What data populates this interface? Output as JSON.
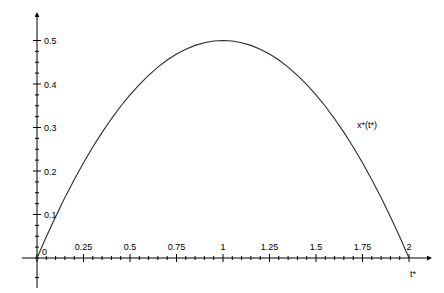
{
  "chart_data": {
    "type": "line",
    "title": "",
    "subtitle": "",
    "xlabel": "t*",
    "ylabel": "",
    "xlim": [
      -0.05,
      2.1
    ],
    "ylim": [
      -0.04,
      0.55
    ],
    "grid": false,
    "legend_position": "inline-annotation",
    "x_ticks_major": [
      "0",
      "0.25",
      "0.5",
      "0.75",
      "1",
      "1.25",
      "1.5",
      "1.75",
      "2"
    ],
    "x_tick_values": [
      0,
      0.25,
      0.5,
      0.75,
      1,
      1.25,
      1.5,
      1.75,
      2
    ],
    "x_minor_step": 0.05,
    "y_ticks_major": [
      "0.1",
      "0.2",
      "0.3",
      "0.4",
      "0.5"
    ],
    "y_tick_values": [
      0.1,
      0.2,
      0.3,
      0.4,
      0.5
    ],
    "y_minor_step": 0.025,
    "origin_label": "0",
    "annotations": [
      {
        "text": "x*(t*)",
        "x": 1.72,
        "y": 0.3
      }
    ],
    "series": [
      {
        "name": "x*(t*)",
        "color": "#2b2b2b",
        "x": [
          0,
          0.05,
          0.1,
          0.15,
          0.2,
          0.25,
          0.3,
          0.35,
          0.4,
          0.45,
          0.5,
          0.55,
          0.6,
          0.65,
          0.7,
          0.75,
          0.8,
          0.85,
          0.9,
          0.95,
          1.0,
          1.05,
          1.1,
          1.15,
          1.2,
          1.25,
          1.3,
          1.35,
          1.4,
          1.45,
          1.5,
          1.55,
          1.6,
          1.65,
          1.7,
          1.75,
          1.8,
          1.85,
          1.9,
          1.95,
          2.0
        ],
        "values": [
          0,
          0.0488,
          0.095,
          0.1388,
          0.18,
          0.2188,
          0.255,
          0.2888,
          0.32,
          0.3488,
          0.375,
          0.3988,
          0.42,
          0.4388,
          0.455,
          0.4688,
          0.48,
          0.4888,
          0.495,
          0.4988,
          0.5,
          0.4988,
          0.495,
          0.4888,
          0.48,
          0.4688,
          0.455,
          0.4388,
          0.42,
          0.3988,
          0.375,
          0.3488,
          0.32,
          0.2888,
          0.255,
          0.2188,
          0.18,
          0.1388,
          0.095,
          0.0488,
          0
        ]
      }
    ]
  },
  "axes": {
    "x_axis_name": "horizontal-axis",
    "y_axis_name": "vertical-axis"
  }
}
